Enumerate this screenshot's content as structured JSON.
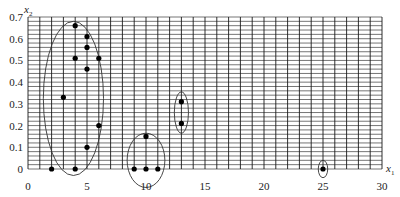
{
  "chart_data": {
    "type": "scatter",
    "title": "",
    "xlabel": "x1",
    "ylabel": "x2",
    "xlabel_parts": {
      "base": "x",
      "sub": "1"
    },
    "ylabel_parts": {
      "base": "x",
      "sub": "2"
    },
    "xlim": [
      0,
      30
    ],
    "ylim": [
      0,
      0.7
    ],
    "grid": {
      "on": true,
      "x_step": 1,
      "y_step": 0.02
    },
    "x_ticks": [
      0,
      5,
      10,
      15,
      20,
      25,
      30
    ],
    "y_ticks": [
      0,
      0.1,
      0.2,
      0.3,
      0.4,
      0.5,
      0.6,
      0.7
    ],
    "x_tick_labels": [
      "0",
      "5",
      "10",
      "15",
      "20",
      "25",
      "30"
    ],
    "y_tick_labels": [
      "0",
      "0.1",
      "0.2",
      "0.3",
      "0.4",
      "0.5",
      "0.6",
      "0.7"
    ],
    "legend": null,
    "points": [
      {
        "x": 2,
        "y": 0,
        "cluster": 1
      },
      {
        "x": 3,
        "y": 0.33,
        "cluster": 1
      },
      {
        "x": 4,
        "y": 0,
        "cluster": 1
      },
      {
        "x": 4,
        "y": 0.51,
        "cluster": 1
      },
      {
        "x": 4,
        "y": 0.66,
        "cluster": 1
      },
      {
        "x": 5,
        "y": 0.1,
        "cluster": 1
      },
      {
        "x": 5,
        "y": 0.46,
        "cluster": 1
      },
      {
        "x": 5,
        "y": 0.56,
        "cluster": 1
      },
      {
        "x": 5,
        "y": 0.61,
        "cluster": 1
      },
      {
        "x": 6,
        "y": 0.2,
        "cluster": 1
      },
      {
        "x": 6,
        "y": 0.51,
        "cluster": 1
      },
      {
        "x": 9,
        "y": 0,
        "cluster": 2
      },
      {
        "x": 10,
        "y": 0,
        "cluster": 2
      },
      {
        "x": 11,
        "y": 0,
        "cluster": 2
      },
      {
        "x": 10,
        "y": 0.15,
        "cluster": 2
      },
      {
        "x": 13,
        "y": 0.21,
        "cluster": 3
      },
      {
        "x": 13,
        "y": 0.31,
        "cluster": 3
      },
      {
        "x": 25,
        "y": 0,
        "cluster": 4
      }
    ],
    "cluster_ellipses": [
      {
        "cluster": 1,
        "cx": 3.85,
        "cy": 0.325,
        "rx": 2.55,
        "ry": 0.355
      },
      {
        "cluster": 2,
        "cx": 10.0,
        "cy": 0.04,
        "rx": 1.6,
        "ry": 0.125
      },
      {
        "cluster": 3,
        "cx": 13.0,
        "cy": 0.26,
        "rx": 0.6,
        "ry": 0.095
      },
      {
        "cluster": 4,
        "cx": 25.0,
        "cy": 0.0,
        "rx": 0.4,
        "ry": 0.04
      }
    ],
    "colors": {
      "grid": "#1a1a1a",
      "points": "#000000",
      "ellipses": "#333333",
      "text": "#222222"
    }
  }
}
